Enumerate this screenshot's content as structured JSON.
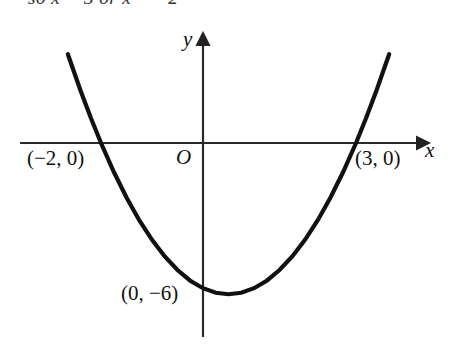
{
  "figure": {
    "top_text_fragment": "so x = 3 or x = −2",
    "axis_labels": {
      "x": "x",
      "y": "y",
      "origin": "O"
    },
    "point_labels": {
      "left_root": "(−2, 0)",
      "right_root": "(3, 0)",
      "y_intercept": "(0, −6)"
    },
    "colors": {
      "curve": "#111111",
      "axis": "#333333",
      "background": "#ffffff"
    }
  },
  "chart_data": {
    "type": "line",
    "title": "",
    "xlabel": "x",
    "ylabel": "y",
    "grid": false,
    "legend": "none",
    "curve_label": "parabola",
    "equation": "y = x^2 - x - 6",
    "xlim": [
      -3.6,
      4.5
    ],
    "ylim": [
      -7.5,
      4.5
    ],
    "roots": [
      -2,
      3
    ],
    "y_intercept": -6,
    "vertex": [
      0.5,
      -6.25
    ],
    "annotations": [
      {
        "text": "(−2, 0)",
        "x": -2,
        "y": 0
      },
      {
        "text": "(3, 0)",
        "x": 3,
        "y": 0
      },
      {
        "text": "(0, −6)",
        "x": 0,
        "y": -6
      },
      {
        "text": "O",
        "x": 0,
        "y": 0
      }
    ],
    "x": [
      -2.65,
      -2.4,
      -2.2,
      -2.0,
      -1.75,
      -1.5,
      -1.25,
      -1.0,
      -0.75,
      -0.5,
      -0.25,
      0,
      0.25,
      0.5,
      0.75,
      1.0,
      1.25,
      1.5,
      1.75,
      2.0,
      2.25,
      2.5,
      2.75,
      3.0,
      3.2,
      3.4,
      3.65
    ],
    "values": [
      3.67,
      2.16,
      1.04,
      0,
      -1.19,
      -2.25,
      -3.19,
      -4,
      -4.69,
      -5.25,
      -5.69,
      -6,
      -6.19,
      -6.25,
      -6.19,
      -6,
      -5.69,
      -5.25,
      -4.69,
      -4,
      -3.19,
      -2.25,
      -1.19,
      0,
      1.04,
      2.16,
      3.67
    ]
  }
}
